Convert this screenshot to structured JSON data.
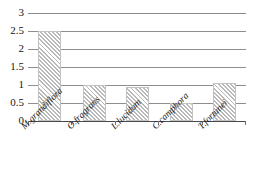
{
  "chart_data": {
    "type": "bar",
    "title": "",
    "xlabel": "",
    "ylabel": "",
    "categories": [
      "M.grandiflora",
      "O.fragrans",
      "L.lucidum",
      "C.camphora",
      "T.fortunei"
    ],
    "values": [
      2.5,
      1.0,
      0.95,
      0.5,
      1.05
    ],
    "ylim": [
      0,
      3
    ],
    "yticks": [
      0,
      0.5,
      1,
      1.5,
      2,
      2.5,
      3
    ],
    "ytick_labels": [
      "0",
      "0.5",
      "1",
      "1.5",
      "2",
      "2.5",
      "3"
    ],
    "grid": true,
    "legend": false,
    "legend_position": "none",
    "bar_style": {
      "fill": "diagonal-hatch",
      "hatch_color": "#b9b9b9",
      "background_color": "#ffffff",
      "border_color": "#c2c2c2"
    },
    "axis_color": "#4a4a4a",
    "gridline_color": "#8e8e8e"
  }
}
